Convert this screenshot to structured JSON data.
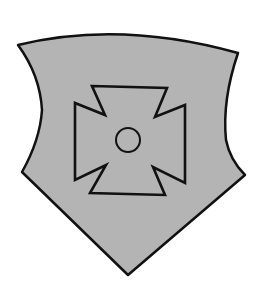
{
  "image": {
    "subject": "heraldic shield with cross pattée",
    "colors": {
      "background": "#ffffff",
      "shield_fill": "#b4b4b4",
      "outline": "#111111"
    }
  },
  "shield": {
    "description": "grey heater-style shield with concave sides"
  },
  "cross": {
    "description": "cross pattée with small central roundel"
  }
}
